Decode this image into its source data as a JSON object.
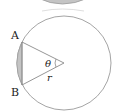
{
  "diagram": {
    "labels": {
      "point_a": "A",
      "point_b": "B",
      "angle": "θ",
      "radius": "r"
    },
    "colors": {
      "stroke": "#9a9a9a",
      "shade": "#c4c4c4",
      "text": "#222222"
    }
  }
}
